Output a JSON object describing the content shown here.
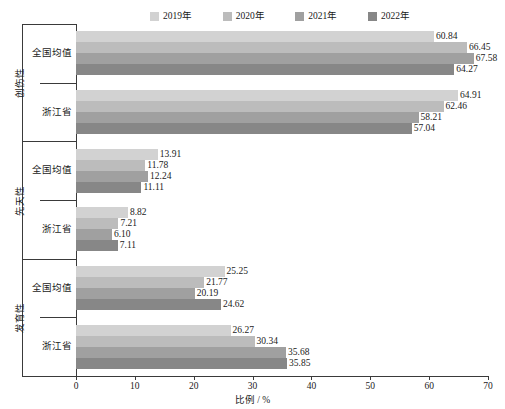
{
  "chart_data": {
    "type": "bar",
    "orientation": "horizontal",
    "title": "",
    "xlabel": "比例 / %",
    "ylabel": "",
    "xlim": [
      0,
      70
    ],
    "xticks": [
      0,
      10,
      20,
      30,
      40,
      50,
      60,
      70
    ],
    "grid": false,
    "legend_position": "top",
    "legend": [
      "2019年",
      "2020年",
      "2021年",
      "2022年"
    ],
    "series_colors": [
      "#d2d2d2",
      "#bcbcbc",
      "#a0a0a0",
      "#878787"
    ],
    "groups": [
      {
        "name": "创伤性",
        "categories": [
          {
            "label": "全国均值",
            "values": [
              60.84,
              66.45,
              67.58,
              64.27
            ]
          },
          {
            "label": "浙江省",
            "values": [
              64.91,
              62.46,
              58.21,
              57.04
            ]
          }
        ]
      },
      {
        "name": "先天性",
        "categories": [
          {
            "label": "全国均值",
            "values": [
              13.91,
              11.78,
              12.24,
              11.11
            ]
          },
          {
            "label": "浙江省",
            "values": [
              8.82,
              7.21,
              6.1,
              7.11
            ]
          }
        ]
      },
      {
        "name": "发育性",
        "categories": [
          {
            "label": "全国均值",
            "values": [
              25.25,
              21.77,
              20.19,
              24.62
            ]
          },
          {
            "label": "浙江省",
            "values": [
              26.27,
              30.34,
              35.68,
              35.85
            ]
          }
        ]
      }
    ],
    "value_labels": [
      [
        "60.84",
        "66.45",
        "67.58",
        "64.27"
      ],
      [
        "64.91",
        "62.46",
        "58.21",
        "57.04"
      ],
      [
        "13.91",
        "11.78",
        "12.24",
        "11.11"
      ],
      [
        "8.82",
        "7.21",
        "6.10",
        "7.11"
      ],
      [
        "25.25",
        "21.77",
        "20.19",
        "24.62"
      ],
      [
        "26.27",
        "30.34",
        "35.68",
        "35.85"
      ]
    ]
  },
  "caption": ""
}
